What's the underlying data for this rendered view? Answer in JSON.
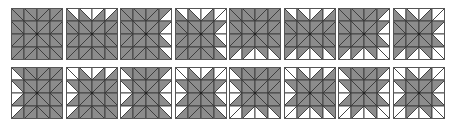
{
  "figure": {
    "colors": {
      "shaded": "#8c8c8c",
      "white": "#ffffff",
      "line": "#3a3a3a",
      "border": "#555555"
    },
    "layout": {
      "rows": 2,
      "cols": 8,
      "tile_size": 52,
      "pitch_x": 54.5,
      "pitch_y": 59
    },
    "tiles": [
      {
        "id": 1,
        "white_sides": []
      },
      {
        "id": 2,
        "white_sides": [
          "top"
        ]
      },
      {
        "id": 3,
        "white_sides": [
          "right"
        ]
      },
      {
        "id": 4,
        "white_sides": [
          "top",
          "right"
        ]
      },
      {
        "id": 5,
        "white_sides": [
          "bottom"
        ]
      },
      {
        "id": 6,
        "white_sides": [
          "top",
          "bottom"
        ]
      },
      {
        "id": 7,
        "white_sides": [
          "right",
          "bottom"
        ]
      },
      {
        "id": 8,
        "white_sides": [
          "top",
          "right",
          "bottom"
        ]
      },
      {
        "id": 9,
        "white_sides": [
          "left"
        ]
      },
      {
        "id": 10,
        "white_sides": [
          "top",
          "left"
        ]
      },
      {
        "id": 11,
        "white_sides": [
          "left",
          "right"
        ]
      },
      {
        "id": 12,
        "white_sides": [
          "top",
          "left",
          "right"
        ]
      },
      {
        "id": 13,
        "white_sides": [
          "left",
          "bottom"
        ]
      },
      {
        "id": 14,
        "white_sides": [
          "top",
          "left",
          "bottom"
        ]
      },
      {
        "id": 15,
        "white_sides": [
          "left",
          "right",
          "bottom"
        ]
      },
      {
        "id": 16,
        "white_sides": [
          "top",
          "left",
          "right",
          "bottom"
        ]
      }
    ]
  }
}
